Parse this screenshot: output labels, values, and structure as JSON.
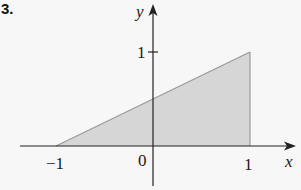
{
  "problem": {
    "number": "3."
  },
  "colors": {
    "background": "#f7f7f7",
    "region_fill": "#d6d6d6",
    "region_edge": "#9a9a9a",
    "axis": "#222222",
    "text": "#1a1a1a"
  },
  "axes": {
    "x_label": "x",
    "y_label": "y",
    "x_ticks": [
      {
        "value": -1,
        "label": "−1"
      },
      {
        "value": 0,
        "label": "0"
      },
      {
        "value": 1,
        "label": "1"
      }
    ],
    "y_ticks": [
      {
        "value": 1,
        "label": "1"
      }
    ]
  },
  "region": {
    "description": "Shaded region under the line y = (x+1)/2 from x = -1 to x = 1",
    "vertices": [
      [
        -1,
        0
      ],
      [
        1,
        1
      ],
      [
        1,
        0
      ]
    ],
    "boundary_line": "y = (x + 1) / 2"
  },
  "labels": {
    "origin": "0",
    "x_neg_one": "−1",
    "x_one": "1",
    "y_one": "1",
    "x_axis": "x",
    "y_axis": "y"
  }
}
